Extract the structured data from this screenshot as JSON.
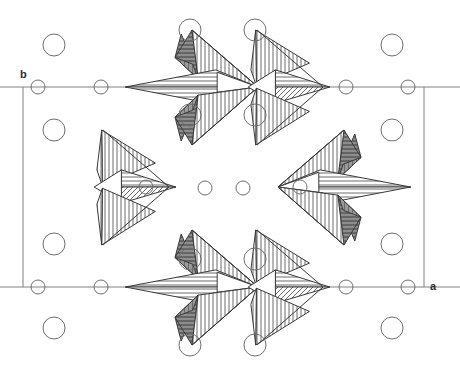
{
  "figure": {
    "kind": "crystal-structure-projection",
    "width": 460,
    "height": 373,
    "background": "#ffffff",
    "line_color": "#3a3a3a",
    "cell_line_color": "#808080",
    "atom_stroke": "#6e6e6e",
    "atom_fill": "#ffffff",
    "hatch_color": "#555555",
    "dark_face_fill": "#6a6a6a"
  },
  "axes": {
    "b_label": "b",
    "b_label_x": 20,
    "b_label_y": 78,
    "a_label": "a",
    "a_label_x": 430,
    "a_label_y": 290
  },
  "unit_cell": {
    "x0": 23,
    "y0": 87,
    "x1": 424,
    "y1": 287,
    "stroke_width": 1
  },
  "atoms": {
    "large_radius": 11,
    "small_radius": 7,
    "large": [
      {
        "cx": 54,
        "cy": 45
      },
      {
        "cx": 190,
        "cy": 30
      },
      {
        "cx": 255,
        "cy": 30
      },
      {
        "cx": 392,
        "cy": 45
      },
      {
        "cx": 54,
        "cy": 130
      },
      {
        "cx": 190,
        "cy": 115
      },
      {
        "cx": 255,
        "cy": 115
      },
      {
        "cx": 392,
        "cy": 130
      },
      {
        "cx": 54,
        "cy": 244
      },
      {
        "cx": 190,
        "cy": 259
      },
      {
        "cx": 255,
        "cy": 259
      },
      {
        "cx": 392,
        "cy": 244
      },
      {
        "cx": 54,
        "cy": 328
      },
      {
        "cx": 190,
        "cy": 345
      },
      {
        "cx": 255,
        "cy": 345
      },
      {
        "cx": 392,
        "cy": 328
      }
    ],
    "small": [
      {
        "cx": 38,
        "cy": 87
      },
      {
        "cx": 101,
        "cy": 87
      },
      {
        "cx": 346,
        "cy": 87
      },
      {
        "cx": 408,
        "cy": 87
      },
      {
        "cx": 38,
        "cy": 287
      },
      {
        "cx": 101,
        "cy": 287
      },
      {
        "cx": 346,
        "cy": 287
      },
      {
        "cx": 408,
        "cy": 287
      },
      {
        "cx": 146,
        "cy": 187
      },
      {
        "cx": 205,
        "cy": 188
      },
      {
        "cx": 243,
        "cy": 188
      },
      {
        "cx": 300,
        "cy": 187
      }
    ]
  },
  "clusters": [
    {
      "id": "top-left",
      "cx": 190,
      "cy": 87,
      "dir": "right",
      "shade": "dark"
    },
    {
      "id": "top-right",
      "cx": 255,
      "cy": 87,
      "dir": "right",
      "shade": "light"
    },
    {
      "id": "mid-left",
      "cx": 101,
      "cy": 187,
      "dir": "right",
      "shade": "light"
    },
    {
      "id": "mid-right",
      "cx": 346,
      "cy": 187,
      "dir": "left",
      "shade": "dark"
    },
    {
      "id": "bottom-left",
      "cx": 190,
      "cy": 287,
      "dir": "right",
      "shade": "dark"
    },
    {
      "id": "bottom-right",
      "cx": 255,
      "cy": 287,
      "dir": "right",
      "shade": "light"
    }
  ],
  "cluster_geometry": {
    "description": "Each cluster is a stack of three corner-sharing tetrahedra drawn in projection: an upper triangle, a central triangle, and a lower triangle meeting at a shared apex on the horizontal midline.",
    "apex_dx": 68,
    "upper_dy": -57,
    "lower_dy": 58,
    "back_dx": -6
  }
}
